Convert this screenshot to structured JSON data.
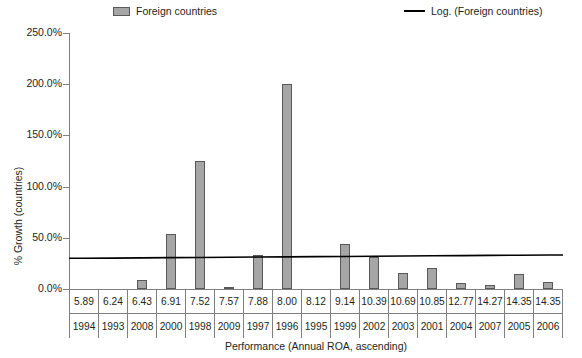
{
  "legend": {
    "series_label": "Foreign countries",
    "trend_label": "Log. (Foreign countries)",
    "series_color": "#a6a6a6",
    "trend_color": "#000000"
  },
  "axes": {
    "y_title": "% Growth (countries)",
    "x_title": "Performance (Annual ROA, ascending)",
    "y_ticks": [
      "0.0%",
      "50.0%",
      "100.0%",
      "150.0%",
      "200.0%",
      "250.0%"
    ]
  },
  "table": {
    "roa_values": [
      "5.89",
      "6.24",
      "6.43",
      "6.91",
      "7.52",
      "7.57",
      "7.88",
      "8.00",
      "8.12",
      "9.14",
      "10.39",
      "10.69",
      "10.85",
      "12.77",
      "14.27",
      "14.35",
      "14.35"
    ],
    "years": [
      "1994",
      "1993",
      "2008",
      "2000",
      "1998",
      "2009",
      "1997",
      "1996",
      "1995",
      "1999",
      "2002",
      "2003",
      "2001",
      "2004",
      "2007",
      "2005",
      "2006"
    ]
  },
  "chart_data": {
    "type": "bar",
    "title": "",
    "xlabel": "Performance (Annual ROA, ascending)",
    "ylabel": "% Growth (countries)",
    "ylim": [
      0,
      250
    ],
    "yticks": [
      0,
      50,
      100,
      150,
      200,
      250
    ],
    "ytick_labels": [
      "0.0%",
      "50.0%",
      "100.0%",
      "150.0%",
      "200.0%",
      "250.0%"
    ],
    "grid": false,
    "legend_position": "top",
    "categories": [
      "5.89",
      "6.24",
      "6.43",
      "6.91",
      "7.52",
      "7.57",
      "7.88",
      "8.00",
      "8.12",
      "9.14",
      "10.39",
      "10.69",
      "10.85",
      "12.77",
      "14.27",
      "14.35",
      "14.35"
    ],
    "category_years": [
      "1994",
      "1993",
      "2008",
      "2000",
      "1998",
      "2009",
      "1997",
      "1996",
      "1995",
      "1999",
      "2002",
      "2003",
      "2001",
      "2004",
      "2007",
      "2005",
      "2006"
    ],
    "series": [
      {
        "name": "Foreign countries",
        "type": "bar",
        "color": "#a6a6a6",
        "values": [
          0,
          0,
          9,
          54,
          125,
          2,
          33,
          200,
          0,
          44,
          31,
          16,
          21,
          6,
          4,
          15,
          7
        ]
      },
      {
        "name": "Log. (Foreign countries)",
        "type": "line",
        "color": "#000000",
        "values": [
          30,
          30.2,
          30.4,
          30.6,
          30.8,
          31.0,
          31.2,
          31.4,
          31.6,
          31.8,
          32.0,
          32.2,
          32.4,
          32.6,
          32.8,
          33.0,
          33.2
        ]
      }
    ]
  }
}
